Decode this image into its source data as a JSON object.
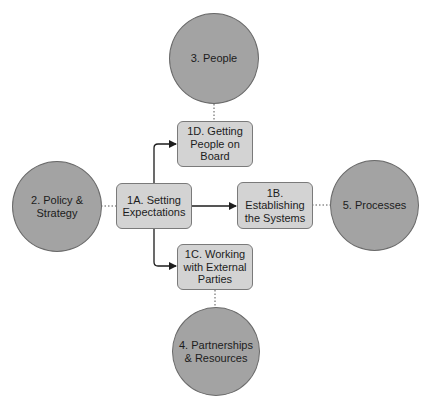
{
  "colors": {
    "circle_fill": "#a3a3a3",
    "box_fill": "#d3d3d3",
    "line": "#1c1c1c",
    "dotted": "#555555"
  },
  "circles": [
    {
      "id": "people",
      "label": "3. People"
    },
    {
      "id": "policy",
      "label": "2. Policy &\nStrategy"
    },
    {
      "id": "processes",
      "label": "5. Processes"
    },
    {
      "id": "partnerships",
      "label": "4. Partnerships\n& Resources"
    }
  ],
  "boxes": [
    {
      "id": "1a",
      "label": "1A. Setting\nExpectations"
    },
    {
      "id": "1b",
      "label": "1B.\nEstablishing\nthe Systems"
    },
    {
      "id": "1c",
      "label": "1C. Working\nwith External\nParties"
    },
    {
      "id": "1d",
      "label": "1D. Getting\nPeople on\nBoard"
    }
  ],
  "edges": [
    {
      "from": "1A",
      "to": "1B",
      "style": "arrow"
    },
    {
      "from": "1A",
      "to": "1C",
      "style": "arrow"
    },
    {
      "from": "1A",
      "to": "1D",
      "style": "arrow"
    },
    {
      "from": "2",
      "to": "1A",
      "style": "dotted"
    },
    {
      "from": "3",
      "to": "1D",
      "style": "dotted"
    },
    {
      "from": "1B",
      "to": "5",
      "style": "dotted"
    },
    {
      "from": "1C",
      "to": "4",
      "style": "dotted"
    }
  ]
}
